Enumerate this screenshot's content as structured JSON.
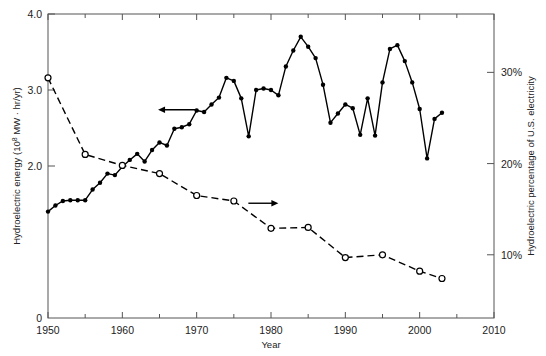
{
  "chart_data": {
    "type": "line",
    "title": "",
    "xlabel": "Year",
    "ylabel": "Hydroelectric energy (10⁸ MW · hr/yr)",
    "y2label": "Hydroelectric percentage of U.S. electricity",
    "xlim": [
      1950,
      2010
    ],
    "ylim": [
      0,
      4.0
    ],
    "y2lim": [
      3.07,
      36.4
    ],
    "grid": false,
    "legend": "arrow-annotations",
    "xticks": [
      1950,
      1960,
      1970,
      1980,
      1990,
      2000,
      2010
    ],
    "xticklabels": [
      "1950",
      "1960",
      "1970",
      "1980",
      "1990",
      "2000",
      "2010"
    ],
    "xminorticks": [
      1955,
      1965,
      1975,
      1985,
      1995,
      2005
    ],
    "yticks": [
      0,
      2.0,
      3.0,
      4.0
    ],
    "yticklabels": [
      "0",
      "2.0",
      "3.0",
      "4.0"
    ],
    "y2ticks": [
      10,
      20,
      30
    ],
    "y2ticklabels": [
      "10%",
      "20%",
      "30%"
    ],
    "annotations": [
      {
        "text": "left-arrow",
        "points_to": "left-axis",
        "x": 1967.5,
        "y": 2.74
      },
      {
        "text": "right-arrow",
        "points_to": "right-axis",
        "x": 1978.3,
        "y": 1.51
      }
    ],
    "series": [
      {
        "name": "Hydroelectric energy (10^8 MW·hr/yr)",
        "axis": "left",
        "style": "solid",
        "marker": "filled-circle",
        "color": "#000000",
        "x": [
          1950,
          1951,
          1952,
          1953,
          1954,
          1955,
          1956,
          1957,
          1958,
          1959,
          1960,
          1961,
          1962,
          1963,
          1964,
          1965,
          1966,
          1967,
          1968,
          1969,
          1970,
          1971,
          1972,
          1973,
          1974,
          1975,
          1976,
          1977,
          1978,
          1979,
          1980,
          1981,
          1982,
          1983,
          1984,
          1985,
          1986,
          1987,
          1988,
          1989,
          1990,
          1991,
          1992,
          1993,
          1994,
          1995,
          1996,
          1997,
          1998,
          1999,
          2000,
          2001,
          2002,
          2003
        ],
        "values": [
          1.4,
          1.48,
          1.54,
          1.55,
          1.55,
          1.55,
          1.69,
          1.78,
          1.9,
          1.88,
          1.99,
          2.08,
          2.16,
          2.06,
          2.21,
          2.31,
          2.27,
          2.49,
          2.51,
          2.55,
          2.73,
          2.71,
          2.81,
          2.9,
          3.16,
          3.12,
          2.89,
          2.39,
          3.0,
          3.02,
          3.0,
          2.93,
          3.31,
          3.52,
          3.7,
          3.57,
          3.42,
          3.07,
          2.57,
          2.69,
          2.81,
          2.76,
          2.41,
          2.89,
          2.4,
          3.1,
          3.54,
          3.59,
          3.38,
          3.1,
          2.75,
          2.1,
          2.62,
          2.7
        ]
      },
      {
        "name": "Hydroelectric percentage of U.S. electricity",
        "axis": "right",
        "style": "dashed",
        "marker": "open-circle",
        "color": "#000000",
        "x": [
          1950,
          1955,
          1960,
          1965,
          1970,
          1975,
          1980,
          1985,
          1990,
          1995,
          2000,
          2003
        ],
        "values": [
          29.4,
          21.0,
          19.8,
          18.9,
          16.5,
          15.9,
          12.9,
          13.0,
          9.7,
          10.0,
          8.2,
          7.4
        ]
      }
    ]
  }
}
